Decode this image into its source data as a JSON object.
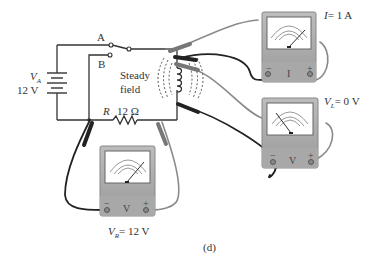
{
  "figure": {
    "caption": "(d)",
    "circuit": {
      "switch": {
        "position_a_label": "A",
        "position_b_label": "B",
        "selected": "B"
      },
      "source": {
        "symbol": "V",
        "subscript": "A",
        "value_label": "12  V"
      },
      "resistor": {
        "symbol": "R",
        "value_label": "12  Ω"
      },
      "inductor": {
        "field_label_line1": "Steady",
        "field_label_line2": "field"
      }
    },
    "meters": [
      {
        "id": "ammeter",
        "type_letter": "I",
        "minus": "−",
        "plus": "+",
        "reading_symbol": "I",
        "reading_subscript": "",
        "reading_value": "= 1  A"
      },
      {
        "id": "voltmeter-inductor",
        "type_letter": "V",
        "minus": "−",
        "plus": "+",
        "reading_symbol": "V",
        "reading_subscript": "L",
        "reading_value": "= 0  V"
      },
      {
        "id": "voltmeter-resistor",
        "type_letter": "V",
        "minus": "−",
        "plus": "+",
        "reading_symbol": "V",
        "reading_subscript": "R",
        "reading_value": "= 12  V"
      }
    ]
  }
}
